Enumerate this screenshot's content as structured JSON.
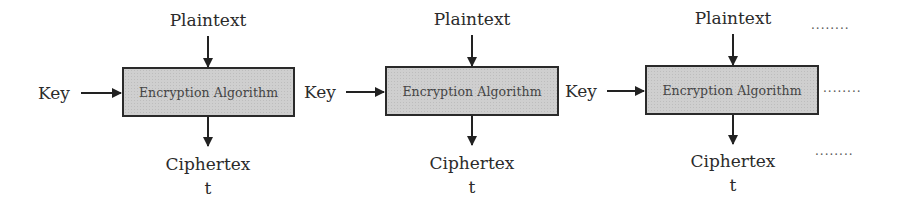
{
  "diagram": {
    "type": "block-diagram",
    "colors": {
      "box_fill": "#cfcfcf",
      "box_border": "#2a2a2a",
      "text": "#2b2b2b",
      "arrow": "#222222"
    },
    "stages": [
      {
        "plaintext_label": "Plaintext",
        "key_label": "Key",
        "box_label": "Encryption Algorithm",
        "ciphertext_line1": "Ciphertex",
        "ciphertext_line2": "t"
      },
      {
        "plaintext_label": "Plaintext",
        "key_label": "Key",
        "box_label": "Encryption Algorithm",
        "ciphertext_line1": "Ciphertex",
        "ciphertext_line2": "t"
      },
      {
        "plaintext_label": "Plaintext",
        "key_label": "Key",
        "box_label": "Encryption Algorithm",
        "ciphertext_line1": "Ciphertex",
        "ciphertext_line2": "t"
      }
    ],
    "continuation": {
      "top": "........",
      "middle": "........",
      "bottom": "........"
    }
  }
}
